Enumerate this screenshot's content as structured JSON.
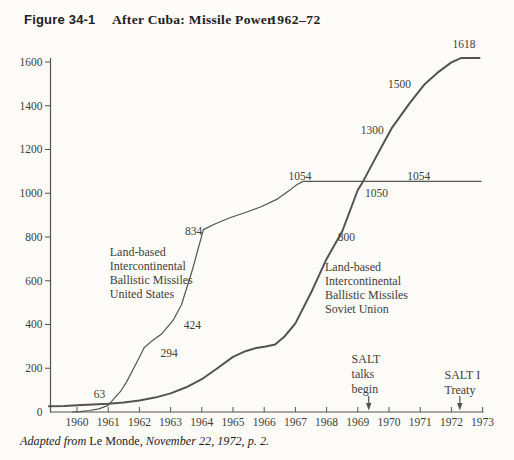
{
  "title": {
    "figure_label": "Figure 34-1",
    "main": "After Cuba: Missile Power",
    "years": "1962–72"
  },
  "caption": {
    "adapted": "Adapted from ",
    "source": "Le Monde,",
    "rest": " November 22, 1972, p. 2."
  },
  "colors": {
    "paper": "#fcfbf8",
    "line": "#55534f",
    "text": "#403e39",
    "title_text": "#23211d"
  },
  "chart_data": {
    "type": "line",
    "title": "After Cuba: Missile Power 1962–72",
    "xlabel": "",
    "ylabel": "",
    "x_range": [
      1959,
      1973
    ],
    "y_range": [
      0,
      1650
    ],
    "grid": false,
    "legend_position": "none",
    "x_ticks": [
      1960,
      1961,
      1962,
      1963,
      1964,
      1965,
      1966,
      1967,
      1968,
      1969,
      1970,
      1971,
      1972,
      1973
    ],
    "y_ticks": [
      0,
      200,
      400,
      600,
      800,
      1000,
      1200,
      1400,
      1600
    ],
    "series": [
      {
        "id": "us",
        "name": "Land-based Intercontinental Ballistic Missiles United States",
        "stroke_width": 1.2,
        "labeled_values": [
          {
            "year": 1961,
            "value": 63
          },
          {
            "year": 1962,
            "value": 294
          },
          {
            "year": 1963,
            "value": 424
          },
          {
            "year": 1964,
            "value": 834
          },
          {
            "year": 1967,
            "value": 1054
          },
          {
            "year": 1972,
            "value": 1054
          }
        ],
        "points": [
          [
            1959.85,
            0
          ],
          [
            1960.1,
            2
          ],
          [
            1960.4,
            7
          ],
          [
            1960.7,
            14
          ],
          [
            1961.0,
            30
          ],
          [
            1961.2,
            63
          ],
          [
            1961.4,
            95
          ],
          [
            1961.6,
            140
          ],
          [
            1961.8,
            195
          ],
          [
            1962.0,
            250
          ],
          [
            1962.15,
            294
          ],
          [
            1962.4,
            325
          ],
          [
            1962.7,
            355
          ],
          [
            1963.0,
            405
          ],
          [
            1963.1,
            424
          ],
          [
            1963.35,
            490
          ],
          [
            1963.7,
            650
          ],
          [
            1964.05,
            834
          ],
          [
            1964.4,
            858
          ],
          [
            1964.9,
            888
          ],
          [
            1965.4,
            912
          ],
          [
            1965.9,
            938
          ],
          [
            1966.4,
            972
          ],
          [
            1966.8,
            1012
          ],
          [
            1967.05,
            1040
          ],
          [
            1967.25,
            1054
          ],
          [
            1972.95,
            1054
          ]
        ]
      },
      {
        "id": "ussr",
        "name": "Land-based Intercontinental Ballistic Missiles Soviet Union",
        "stroke_width": 2,
        "labeled_values": [
          {
            "year": 1966,
            "value": 300
          },
          {
            "year": 1968,
            "value": 800
          },
          {
            "year": 1969,
            "value": 1050
          },
          {
            "year": 1970,
            "value": 1300
          },
          {
            "year": 1971,
            "value": 1500
          },
          {
            "year": 1972,
            "value": 1618
          }
        ],
        "points": [
          [
            1959.1,
            26
          ],
          [
            1959.6,
            28
          ],
          [
            1960.0,
            31
          ],
          [
            1960.5,
            34
          ],
          [
            1961.0,
            38
          ],
          [
            1961.5,
            44
          ],
          [
            1962.0,
            53
          ],
          [
            1962.5,
            66
          ],
          [
            1963.0,
            85
          ],
          [
            1963.5,
            113
          ],
          [
            1964.0,
            150
          ],
          [
            1964.5,
            200
          ],
          [
            1965.0,
            252
          ],
          [
            1965.4,
            278
          ],
          [
            1965.75,
            293
          ],
          [
            1966.05,
            300
          ],
          [
            1966.35,
            308
          ],
          [
            1966.65,
            345
          ],
          [
            1967.0,
            405
          ],
          [
            1967.5,
            545
          ],
          [
            1968.0,
            700
          ],
          [
            1968.5,
            825
          ],
          [
            1969.0,
            1015
          ],
          [
            1969.17,
            1054
          ],
          [
            1969.6,
            1170
          ],
          [
            1970.1,
            1300
          ],
          [
            1970.65,
            1410
          ],
          [
            1971.15,
            1500
          ],
          [
            1971.6,
            1556
          ],
          [
            1972.0,
            1598
          ],
          [
            1972.3,
            1618
          ],
          [
            1972.9,
            1618
          ]
        ]
      }
    ],
    "value_labels": [
      {
        "text": "63",
        "year": 1960.72,
        "value": 80
      },
      {
        "text": "294",
        "year": 1962.95,
        "value": 267
      },
      {
        "text": "424",
        "year": 1963.7,
        "value": 395
      },
      {
        "text": "834",
        "year": 1963.74,
        "value": 828
      },
      {
        "text": "1054",
        "year": 1967.15,
        "value": 1080
      },
      {
        "text": "1054",
        "year": 1970.95,
        "value": 1080
      },
      {
        "text": "1050",
        "year": 1969.6,
        "value": 1000
      },
      {
        "text": "800",
        "year": 1968.63,
        "value": 797
      },
      {
        "text": "1300",
        "year": 1969.46,
        "value": 1290
      },
      {
        "text": "1500",
        "year": 1970.34,
        "value": 1497
      },
      {
        "text": "1618",
        "year": 1972.4,
        "value": 1680
      }
    ],
    "series_labels": [
      {
        "series": "us",
        "lines": [
          "Land-based",
          "Intercontinental",
          "Ballistic Missiles",
          "United States"
        ],
        "year": 1961.05,
        "value": 730
      },
      {
        "series": "ussr",
        "lines": [
          "Land-based",
          "Intercontinental",
          "Ballistic Missiles",
          "Soviet Union"
        ],
        "year": 1967.95,
        "value": 662
      }
    ],
    "events": [
      {
        "lines": [
          "SALT",
          "talks",
          "begin"
        ],
        "text_year": 1968.8,
        "text_value": 243,
        "arrow_year": 1969.35
      },
      {
        "lines": [
          "SALT I",
          "Treaty"
        ],
        "text_year": 1971.78,
        "text_value": 170,
        "arrow_year": 1972.27
      }
    ]
  }
}
